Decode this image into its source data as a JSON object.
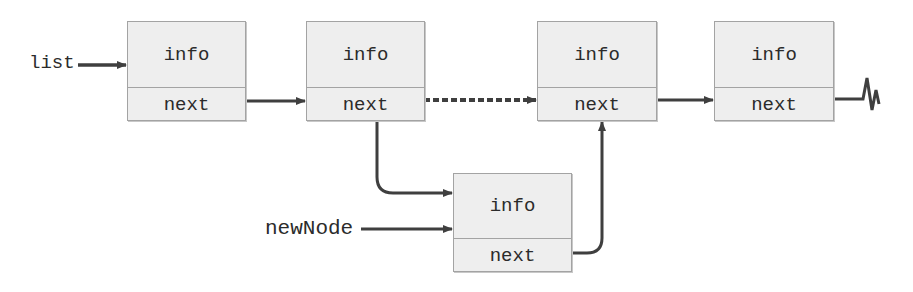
{
  "diagram": {
    "colors": {
      "node_fill": "#eeeeee",
      "node_border": "#a3a3a3",
      "arrow": "#3f3f3f",
      "text": "#2b2b2b"
    },
    "labels": {
      "list": "list",
      "newNode": "newNode"
    },
    "nodes": [
      {
        "id": "n1",
        "info": "info",
        "next": "next",
        "x": 127,
        "y": 21,
        "w": 119,
        "h": 100,
        "divider": 65
      },
      {
        "id": "n2",
        "info": "info",
        "next": "next",
        "x": 306,
        "y": 21,
        "w": 119,
        "h": 100,
        "divider": 65
      },
      {
        "id": "n3",
        "info": "info",
        "next": "next",
        "x": 537,
        "y": 21,
        "w": 120,
        "h": 100,
        "divider": 65
      },
      {
        "id": "n4",
        "info": "info",
        "next": "next",
        "x": 714,
        "y": 21,
        "w": 120,
        "h": 100,
        "divider": 65
      },
      {
        "id": "new",
        "info": "info",
        "next": "next",
        "x": 453,
        "y": 173,
        "w": 119,
        "h": 99,
        "divider": 64
      }
    ],
    "edges": [
      {
        "from": "list",
        "to": "n1",
        "style": "solid"
      },
      {
        "from": "n1.next",
        "to": "n2",
        "style": "solid"
      },
      {
        "from": "n2.next",
        "to": "n3",
        "style": "dashed"
      },
      {
        "from": "n3.next",
        "to": "n4",
        "style": "solid"
      },
      {
        "from": "n4.next",
        "to": "null",
        "style": "null-terminator"
      },
      {
        "from": "n2.next",
        "to": "new",
        "style": "solid-curved"
      },
      {
        "from": "newNode",
        "to": "new",
        "style": "solid"
      },
      {
        "from": "new.next",
        "to": "n3",
        "style": "solid-curved"
      }
    ]
  }
}
